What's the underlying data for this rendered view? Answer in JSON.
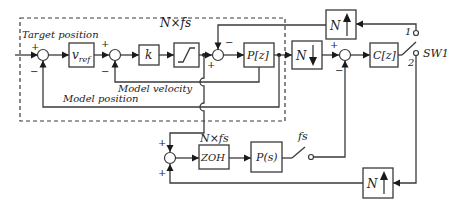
{
  "diagram": {
    "outer_rate_label": "N×fs",
    "labels": {
      "target_position": "Target position",
      "model_velocity": "Model velocity",
      "model_position": "Model position",
      "lower_rate": "N×fs",
      "switch_rate": "fs",
      "switch_name": "SW1",
      "switch_pos_1": "1",
      "switch_pos_2": "2"
    },
    "blocks": {
      "vref": "v",
      "vref_sub": "ref",
      "k": "k",
      "pz": "P[z]",
      "n_down": "N",
      "n_up_top": "N",
      "cz": "C[z]",
      "zoh": "ZOH",
      "ps": "P(s)",
      "n_up_bottom": "N"
    },
    "signs": {
      "sum1_in": "+",
      "sum1_fb": "−",
      "sum2_in": "+",
      "sum2_fb": "−",
      "sum3_in": "+",
      "sum3_fb": "−",
      "sum4_in": "+",
      "sum4_fb": "−",
      "sum5_top": "+",
      "sum5_bottom": "+"
    },
    "colors": {
      "line": "#3a3a3a",
      "arrow": "#1a1a1a",
      "background": "#ffffff"
    }
  }
}
